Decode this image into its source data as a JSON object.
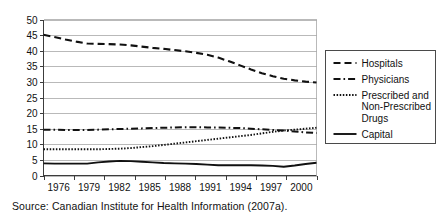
{
  "source_note": "Source: Canadian Institute for Health Information (2007a).",
  "legend": {
    "position": "right",
    "entries": [
      {
        "label": "Hospitals",
        "style": "dashed",
        "dash": "7,4",
        "width": 2.1
      },
      {
        "label": "Physicians",
        "style": "dash-dot",
        "dash": "7,3,1.6,3",
        "width": 2.0
      },
      {
        "label": "Prescribed and Non-Prescribed Drugs",
        "style": "dotted",
        "dash": "1.5,1.6",
        "width": 1.9
      },
      {
        "label": "Capital",
        "style": "solid",
        "dash": "none",
        "width": 1.9
      }
    ]
  },
  "chart_data": {
    "type": "line",
    "title": "",
    "subtitle": "",
    "xlabel": "",
    "ylabel": "",
    "grid": true,
    "xlim": [
      1975,
      2000
    ],
    "ylim": [
      0,
      50
    ],
    "yticks": [
      0,
      5,
      10,
      15,
      20,
      25,
      30,
      35,
      40,
      45,
      50
    ],
    "xticks": [
      1976,
      1979,
      1982,
      1985,
      1988,
      1991,
      1994,
      1997,
      2000
    ],
    "x": [
      1975,
      1976,
      1977,
      1978,
      1979,
      1980,
      1981,
      1982,
      1983,
      1984,
      1985,
      1986,
      1987,
      1988,
      1989,
      1990,
      1991,
      1992,
      1993,
      1994,
      1995,
      1996,
      1997,
      1998,
      1999,
      2000
    ],
    "tick_labels": [
      "1976",
      "1979",
      "1982",
      "1985",
      "1988",
      "1991",
      "1994",
      "1997",
      "2000"
    ],
    "series": [
      {
        "name": "Hospitals",
        "style": "dashed",
        "values": [
          45.1,
          44.4,
          43.6,
          42.9,
          42.3,
          42.2,
          42.1,
          42.0,
          41.7,
          41.3,
          40.9,
          40.6,
          40.2,
          39.8,
          39.3,
          38.7,
          37.8,
          36.6,
          35.3,
          34.0,
          32.8,
          31.8,
          31.0,
          30.5,
          30.1,
          29.8
        ]
      },
      {
        "name": "Physicians",
        "style": "dash-dot",
        "values": [
          14.7,
          14.7,
          14.6,
          14.6,
          14.6,
          14.7,
          14.8,
          14.9,
          15.0,
          15.1,
          15.2,
          15.3,
          15.4,
          15.5,
          15.5,
          15.4,
          15.4,
          15.3,
          15.2,
          15.0,
          14.8,
          14.6,
          14.4,
          14.1,
          13.8,
          13.6
        ]
      },
      {
        "name": "Prescribed and Non-Prescribed Drugs",
        "style": "dotted",
        "values": [
          8.4,
          8.4,
          8.4,
          8.4,
          8.4,
          8.4,
          8.5,
          8.6,
          8.8,
          9.1,
          9.4,
          9.8,
          10.2,
          10.6,
          11.0,
          11.4,
          11.8,
          12.2,
          12.6,
          13.0,
          13.5,
          14.0,
          14.4,
          14.7,
          15.0,
          15.3
        ]
      },
      {
        "name": "Capital",
        "style": "solid",
        "values": [
          3.9,
          3.8,
          3.8,
          3.8,
          3.8,
          4.2,
          4.5,
          4.7,
          4.6,
          4.4,
          4.2,
          4.0,
          3.9,
          3.8,
          3.7,
          3.5,
          3.3,
          3.3,
          3.3,
          3.3,
          3.2,
          3.1,
          2.8,
          3.2,
          3.7,
          4.1
        ]
      }
    ]
  }
}
